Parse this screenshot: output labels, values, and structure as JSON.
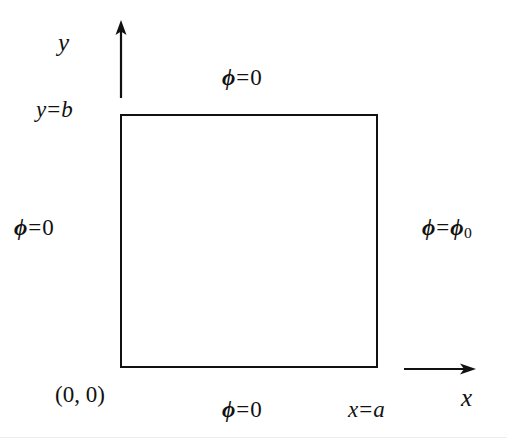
{
  "figure": {
    "kind": "boundary-value-problem-diagram",
    "background_color": "#ffffff",
    "stroke_color": "#111111"
  },
  "axes": {
    "y_axis": {
      "label": "y",
      "direction": "up",
      "arrow_x": 121,
      "arrow_y_start": 95,
      "arrow_y_end": 22
    },
    "x_axis": {
      "label": "x",
      "direction": "right",
      "arrow_y": 368,
      "arrow_x_start": 405,
      "arrow_x_end": 472
    }
  },
  "domain": {
    "shape": "rectangle",
    "left": 120,
    "top": 114,
    "width": 258,
    "height": 254,
    "border_width_px": 2.5,
    "border_color": "#111111",
    "fill": "#ffffff"
  },
  "corner_labels": {
    "origin": "(0, 0)",
    "top_left_height": {
      "variable": "y",
      "equals": "=",
      "value": "b",
      "full": "y = b"
    },
    "bottom_right_width": {
      "variable": "x",
      "equals": "=",
      "value": "a",
      "full": "x = a"
    }
  },
  "boundary_conditions": {
    "top": {
      "symbol": "ϕ",
      "equals": "=",
      "value": "0",
      "subscript": "",
      "full": "ϕ = 0",
      "edge": "y = b"
    },
    "left": {
      "symbol": "ϕ",
      "equals": "=",
      "value": "0",
      "subscript": "",
      "full": "ϕ = 0",
      "edge": "x = 0"
    },
    "right": {
      "symbol": "ϕ",
      "equals": "=",
      "value": "ϕ",
      "subscript": "0",
      "full": "ϕ = ϕ₀",
      "edge": "x = a"
    },
    "bottom": {
      "symbol": "ϕ",
      "equals": "=",
      "value": "0",
      "subscript": "",
      "full": "ϕ = 0",
      "edge": "y = 0"
    }
  }
}
